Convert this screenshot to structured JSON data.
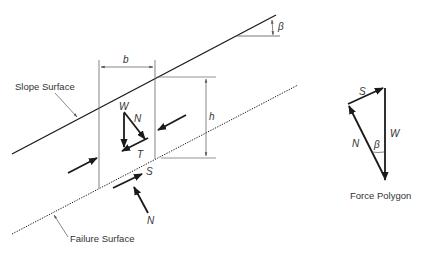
{
  "diagram": {
    "type": "infinite-slope-slice-free-body",
    "labels": {
      "slope_surface": "Slope Surface",
      "failure_surface": "Failure Surface",
      "force_polygon": "Force Polygon",
      "width": "b",
      "height": "h",
      "angle": "β"
    },
    "slice_forces": {
      "weight": "W",
      "normal": "N",
      "tangential": "T"
    },
    "base_forces": {
      "shear": "S",
      "normal": "N"
    },
    "polygon_forces": {
      "shear": "S",
      "weight": "W",
      "normal": "N",
      "angle": "β"
    },
    "colors": {
      "line": "#1a1a1a",
      "dimension": "#555555",
      "text": "#333333",
      "background": "#ffffff"
    }
  }
}
